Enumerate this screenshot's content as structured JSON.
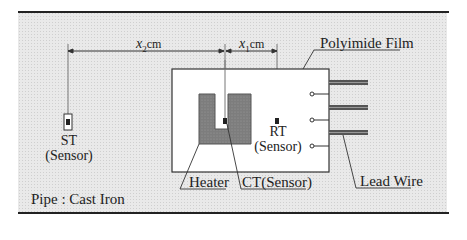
{
  "diagram": {
    "dimensions": {
      "x2": {
        "var": "x",
        "sub": "2",
        "unit": "cm"
      },
      "x1": {
        "var": "x",
        "sub": "1",
        "unit": "cm"
      }
    },
    "labels": {
      "polyimide_film": "Polyimide Film",
      "st_name": "ST",
      "st_type": "(Sensor)",
      "rt_name": "RT",
      "rt_type": "(Sensor)",
      "heater": "Heater",
      "ct_sensor": "CT(Sensor)",
      "lead_wire": "Lead Wire",
      "pipe": "Pipe : Cast Iron"
    },
    "colors": {
      "line": "#222222",
      "heater_fill": "#7a7a7a",
      "background_dots": "#e9e9e9",
      "film": "#ffffff"
    }
  }
}
